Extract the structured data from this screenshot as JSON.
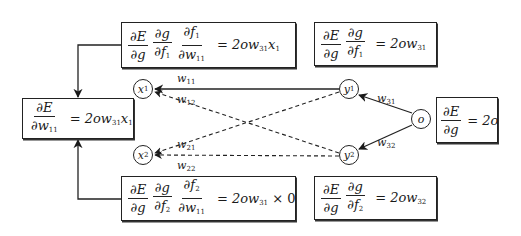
{
  "diagram": {
    "nodes": {
      "x1": {
        "label": "x",
        "sub": "1"
      },
      "x2": {
        "label": "x",
        "sub": "2"
      },
      "y1": {
        "label": "y",
        "sub": "1"
      },
      "y2": {
        "label": "y",
        "sub": "2"
      },
      "o": {
        "label": "o"
      }
    },
    "edges": {
      "w11": {
        "label": "w",
        "sub": "11",
        "from": "y1",
        "to": "x1",
        "style": "solid"
      },
      "w12": {
        "label": "w",
        "sub": "12",
        "from": "y2",
        "to": "x1",
        "style": "dashed"
      },
      "w21": {
        "label": "w",
        "sub": "21",
        "from": "y1",
        "to": "x2",
        "style": "dashed"
      },
      "w22": {
        "label": "w",
        "sub": "22",
        "from": "y2",
        "to": "x2",
        "style": "dashed"
      },
      "w31": {
        "label": "w",
        "sub": "31",
        "from": "o",
        "to": "y1",
        "style": "solid"
      },
      "w32": {
        "label": "w",
        "sub": "32",
        "from": "o",
        "to": "y2",
        "style": "solid"
      }
    },
    "boxes": {
      "top_left": {
        "fractions": [
          {
            "num": "∂E",
            "den": "∂g"
          },
          {
            "num": "∂g",
            "den": "∂f",
            "den_sub": "1"
          },
          {
            "num": "∂f",
            "num_sub": "1",
            "den": "∂w",
            "den_sub": "11"
          }
        ],
        "rhs_prefix": "2ow",
        "rhs_sub": "31",
        "rhs_suffix": "x",
        "rhs_suffix_sub": "1"
      },
      "top_right": {
        "fractions": [
          {
            "num": "∂E",
            "den": "∂g"
          },
          {
            "num": "∂g",
            "den": "∂f",
            "den_sub": "1"
          }
        ],
        "rhs_prefix": "2ow",
        "rhs_sub": "31"
      },
      "left": {
        "fractions": [
          {
            "num": "∂E",
            "den": "∂w",
            "den_sub": "11"
          }
        ],
        "rhs_prefix": "2ow",
        "rhs_sub": "31",
        "rhs_suffix": "x",
        "rhs_suffix_sub": "1"
      },
      "right": {
        "fractions": [
          {
            "num": "∂E",
            "den": "∂g"
          }
        ],
        "rhs_prefix": "2o"
      },
      "bottom_left": {
        "fractions": [
          {
            "num": "∂E",
            "den": "∂g"
          },
          {
            "num": "∂g",
            "den": "∂f",
            "den_sub": "2"
          },
          {
            "num": "∂f",
            "num_sub": "2",
            "den": "∂w",
            "den_sub": "11"
          }
        ],
        "rhs_prefix": "2ow",
        "rhs_sub": "31",
        "rhs_times": "× 0"
      },
      "bottom_right": {
        "fractions": [
          {
            "num": "∂E",
            "den": "∂g"
          },
          {
            "num": "∂g",
            "den": "∂f",
            "den_sub": "2"
          }
        ],
        "rhs_prefix": "2ow",
        "rhs_sub": "32"
      }
    },
    "equals": "="
  }
}
